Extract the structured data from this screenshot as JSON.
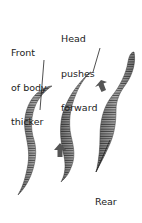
{
  "labels": {
    "front": {
      "line1": "Front",
      "line2": "of body",
      "line3": "thicker"
    },
    "head": {
      "line1": "Head",
      "line2": "pushes",
      "line3": "forward"
    },
    "rear": {
      "line1": "Rear",
      "line2": "of body",
      "line3": "thicker"
    }
  },
  "colors": {
    "worm_fill": "#9a9a9a",
    "worm_stripe": "#444444",
    "arrow": "#555555",
    "text": "#222222"
  },
  "icons": [
    "up-arrow-icon",
    "up-arrow-icon"
  ]
}
